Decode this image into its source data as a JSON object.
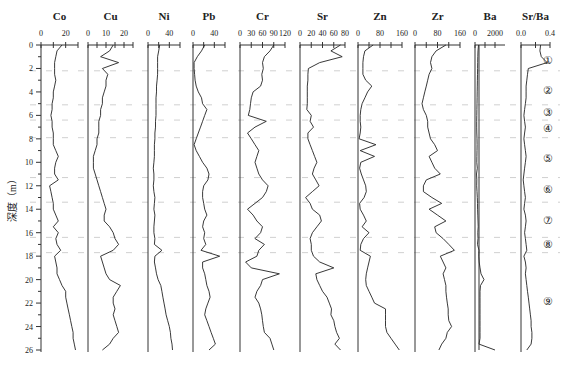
{
  "chart_data": {
    "type": "line",
    "title": "",
    "ylabel": "深度（m）",
    "ylim": [
      0,
      26
    ],
    "y_ticks": [
      0,
      2,
      4,
      6,
      8,
      10,
      12,
      14,
      16,
      18,
      20,
      22,
      24,
      26
    ],
    "y_inverted": true,
    "depths": [
      0,
      0.5,
      1,
      1.5,
      2,
      2.5,
      3,
      3.5,
      4,
      4.5,
      5,
      5.5,
      6,
      6.5,
      7,
      7.5,
      8,
      8.5,
      9,
      9.5,
      10,
      10.5,
      11,
      11.5,
      12,
      12.5,
      13,
      13.5,
      14,
      14.5,
      15,
      15.5,
      16,
      16.5,
      17,
      17.5,
      18,
      18.5,
      19,
      19.5,
      20,
      20.5,
      21,
      21.5,
      22,
      22.5,
      23,
      23.5,
      24,
      24.5,
      25,
      25.5,
      26
    ],
    "panels": [
      {
        "name": "Co",
        "xlim": [
          0,
          30
        ],
        "tick_labels": [
          "0",
          "20"
        ],
        "tick_label_values": [
          0,
          20
        ],
        "minor_ticks": [
          0,
          10,
          20,
          30
        ],
        "values": [
          17,
          13,
          12,
          11,
          11,
          11,
          12,
          11,
          10,
          10,
          9,
          9,
          8,
          9,
          9,
          10,
          10,
          10,
          12,
          14,
          12,
          11,
          11,
          14,
          7,
          8,
          9,
          10,
          10,
          12,
          14,
          10,
          14,
          12,
          13,
          16,
          11,
          12,
          13,
          13,
          15,
          17,
          20,
          20,
          21,
          22,
          23,
          24,
          25,
          26,
          26,
          27,
          28
        ]
      },
      {
        "name": "Cu",
        "xlim": [
          0,
          25
        ],
        "tick_labels": [
          "0",
          "10",
          "20"
        ],
        "tick_label_values": [
          0,
          10,
          20
        ],
        "minor_ticks": [
          0,
          5,
          10,
          15,
          20,
          25
        ],
        "values": [
          14,
          12,
          7,
          17,
          8,
          11,
          10,
          10,
          9,
          8,
          8,
          7,
          7,
          6,
          6,
          6,
          5,
          5,
          4,
          3,
          3,
          3,
          4,
          5,
          6,
          7,
          8,
          9,
          10,
          9,
          9,
          12,
          14,
          15,
          17,
          14,
          7,
          8,
          9,
          10,
          12,
          18,
          16,
          14,
          14,
          15,
          14,
          15,
          16,
          17,
          14,
          12,
          8
        ]
      },
      {
        "name": "Ni",
        "xlim": [
          0,
          60
        ],
        "tick_labels": [
          "0",
          "40"
        ],
        "tick_label_values": [
          0,
          40
        ],
        "minor_ticks": [
          0,
          20,
          40,
          60
        ],
        "values": [
          22,
          20,
          18,
          18,
          18,
          18,
          17,
          16,
          16,
          15,
          15,
          15,
          15,
          14,
          14,
          13,
          13,
          12,
          12,
          12,
          11,
          10,
          11,
          11,
          10,
          11,
          13,
          12,
          11,
          13,
          12,
          11,
          11,
          13,
          12,
          26,
          13,
          12,
          14,
          16,
          19,
          24,
          26,
          28,
          30,
          32,
          34,
          37,
          40,
          42,
          43,
          45,
          46
        ]
      },
      {
        "name": "Pb",
        "xlim": [
          0,
          60
        ],
        "tick_labels": [
          "0",
          "40"
        ],
        "tick_label_values": [
          0,
          40
        ],
        "minor_ticks": [
          0,
          20,
          40,
          60
        ],
        "values": [
          22,
          16,
          8,
          2,
          2,
          3,
          4,
          6,
          10,
          16,
          18,
          26,
          22,
          18,
          14,
          10,
          6,
          2,
          6,
          12,
          18,
          26,
          30,
          28,
          20,
          18,
          18,
          20,
          22,
          26,
          20,
          18,
          22,
          20,
          24,
          15,
          50,
          18,
          18,
          22,
          24,
          26,
          30,
          32,
          28,
          24,
          22,
          26,
          30,
          34,
          38,
          42,
          30
        ]
      },
      {
        "name": "Cr",
        "xlim": [
          0,
          120
        ],
        "tick_labels": [
          "0",
          "30",
          "60",
          "90",
          "120"
        ],
        "tick_label_values": [
          0,
          30,
          60,
          90,
          120
        ],
        "minor_ticks": [
          0,
          30,
          60,
          90,
          120
        ],
        "values": [
          90,
          80,
          65,
          60,
          62,
          58,
          60,
          55,
          35,
          30,
          28,
          26,
          22,
          70,
          40,
          20,
          30,
          40,
          50,
          45,
          40,
          45,
          50,
          60,
          75,
          70,
          60,
          40,
          20,
          35,
          45,
          60,
          55,
          40,
          65,
          50,
          45,
          15,
          30,
          105,
          60,
          55,
          45,
          40,
          50,
          55,
          58,
          60,
          62,
          65,
          80,
          85,
          90
        ]
      },
      {
        "name": "Sr",
        "xlim": [
          0,
          80
        ],
        "tick_labels": [
          "0",
          "20",
          "40",
          "60",
          "80"
        ],
        "tick_label_values": [
          0,
          20,
          40,
          60,
          80
        ],
        "minor_ticks": [
          0,
          20,
          40,
          60,
          80
        ],
        "values": [
          72,
          55,
          75,
          35,
          15,
          14,
          14,
          13,
          13,
          13,
          13,
          12,
          20,
          18,
          24,
          14,
          14,
          18,
          22,
          26,
          30,
          25,
          22,
          28,
          34,
          22,
          10,
          18,
          22,
          35,
          38,
          30,
          22,
          18,
          20,
          20,
          24,
          35,
          60,
          28,
          30,
          35,
          40,
          48,
          52,
          56,
          55,
          60,
          62,
          65,
          70,
          62,
          72
        ]
      },
      {
        "name": "Zn",
        "xlim": [
          0,
          160
        ],
        "tick_labels": [
          "0",
          "80",
          "160"
        ],
        "tick_label_values": [
          0,
          80,
          160
        ],
        "minor_ticks": [
          0,
          40,
          80,
          120,
          160
        ],
        "values": [
          55,
          25,
          20,
          18,
          18,
          18,
          28,
          50,
          35,
          25,
          15,
          10,
          8,
          8,
          10,
          8,
          4,
          65,
          8,
          60,
          10,
          6,
          12,
          20,
          28,
          30,
          22,
          6,
          8,
          20,
          30,
          15,
          40,
          20,
          10,
          8,
          45,
          40,
          35,
          30,
          28,
          30,
          40,
          50,
          60,
          100,
          100,
          100,
          100,
          105,
          120,
          135,
          150
        ]
      },
      {
        "name": "Zr",
        "xlim": [
          0,
          160
        ],
        "tick_labels": [
          "0",
          "80",
          "160"
        ],
        "tick_label_values": [
          0,
          80,
          160
        ],
        "minor_ticks": [
          0,
          40,
          80,
          120,
          160
        ],
        "values": [
          110,
          75,
          60,
          55,
          60,
          50,
          45,
          40,
          35,
          30,
          25,
          30,
          40,
          45,
          45,
          50,
          55,
          70,
          80,
          50,
          60,
          70,
          90,
          40,
          30,
          30,
          60,
          95,
          50,
          80,
          110,
          70,
          75,
          100,
          120,
          140,
          90,
          100,
          110,
          100,
          105,
          110,
          110,
          112,
          115,
          118,
          118,
          120,
          130,
          115,
          110,
          95,
          85
        ]
      },
      {
        "name": "Ba",
        "xlim": [
          0,
          3000
        ],
        "tick_labels": [
          "0",
          "2000"
        ],
        "tick_label_values": [
          0,
          2000
        ],
        "minor_ticks": [
          0,
          1000,
          2000
        ],
        "values": [
          350,
          300,
          280,
          270,
          260,
          250,
          240,
          230,
          220,
          210,
          200,
          190,
          180,
          170,
          170,
          180,
          200,
          210,
          200,
          190,
          180,
          230,
          150,
          180,
          170,
          200,
          230,
          250,
          260,
          280,
          300,
          320,
          280,
          300,
          250,
          400,
          380,
          420,
          500,
          600,
          900,
          550,
          500,
          500,
          500,
          500,
          500,
          500,
          500,
          500,
          500,
          400,
          2000
        ]
      },
      {
        "name": "Sr/Ba",
        "xlim": [
          0,
          0.4
        ],
        "tick_labels": [
          "0.0",
          "0.4"
        ],
        "tick_label_values": [
          0,
          0.4
        ],
        "minor_ticks": [
          0,
          0.2,
          0.4
        ],
        "values": [
          0.27,
          0.26,
          0.28,
          0.36,
          0.1,
          0.09,
          0.08,
          0.07,
          0.07,
          0.07,
          0.06,
          0.05,
          0.04,
          0.05,
          0.06,
          0.05,
          0.04,
          0.05,
          0.06,
          0.07,
          0.06,
          0.05,
          0.04,
          0.03,
          0.04,
          0.05,
          0.06,
          0.05,
          0.04,
          0.06,
          0.07,
          0.06,
          0.05,
          0.06,
          0.07,
          0.08,
          0.04,
          0.06,
          0.07,
          0.06,
          0.07,
          0.08,
          0.09,
          0.1,
          0.11,
          0.12,
          0.13,
          0.14,
          0.14,
          0.15,
          0.15,
          0.14,
          0.08
        ]
      }
    ],
    "zone_boundaries_depth": [
      2.2,
      5.1,
      6.4,
      7.9,
      11.3,
      13.4,
      16.4,
      17.7
    ],
    "zones": [
      {
        "label": "①",
        "depth": 1.3
      },
      {
        "label": "②",
        "depth": 3.8
      },
      {
        "label": "③",
        "depth": 5.7
      },
      {
        "label": "④",
        "depth": 7.1
      },
      {
        "label": "⑤",
        "depth": 9.6
      },
      {
        "label": "⑥",
        "depth": 12.3
      },
      {
        "label": "⑦",
        "depth": 14.9
      },
      {
        "label": "⑧",
        "depth": 17.0
      },
      {
        "label": "⑨",
        "depth": 21.8
      }
    ]
  }
}
